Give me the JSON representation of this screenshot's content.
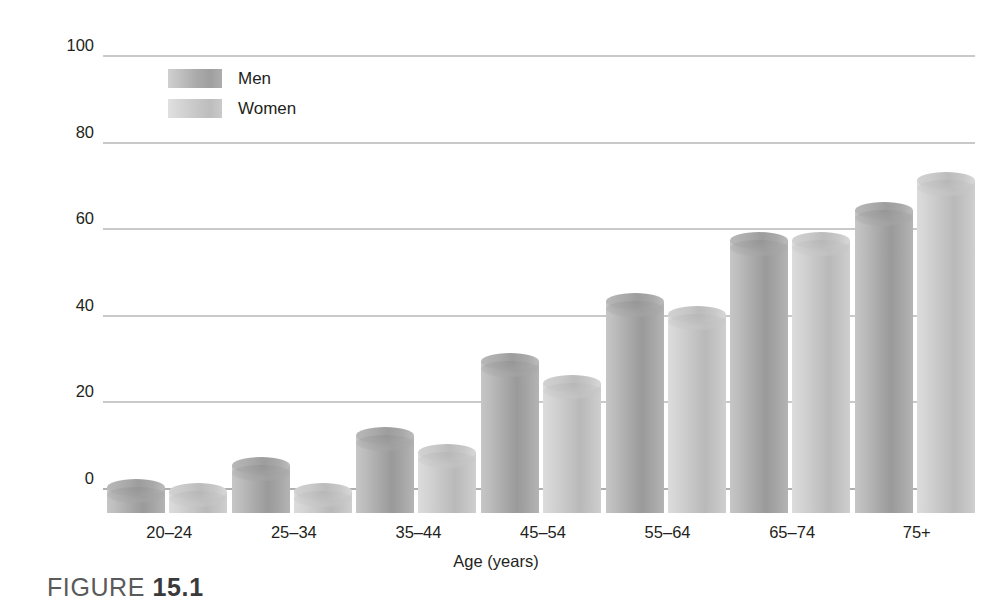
{
  "chart_data": {
    "type": "bar",
    "title": "",
    "xlabel": "Age (years)",
    "ylabel": "Percentage of people with cardiovascular disease",
    "categories": [
      "20–24",
      "25–34",
      "35–44",
      "45–54",
      "55–64",
      "65–74",
      "75+"
    ],
    "series": [
      {
        "name": "Men",
        "values": [
          6,
          11,
          18,
          35,
          49,
          63,
          70
        ]
      },
      {
        "name": "Women",
        "values": [
          5,
          5,
          14,
          30,
          46,
          63,
          77
        ]
      }
    ],
    "ylim": [
      0,
      100
    ],
    "yticks": [
      0,
      20,
      40,
      60,
      80,
      100
    ],
    "ytick_labels": [
      "0",
      "20",
      "40",
      "60",
      "80",
      "100"
    ],
    "grid": true,
    "legend_position": "upper left",
    "colors": {
      "men": "#a8a8a8",
      "women": "#c8c8c8",
      "gridline": "#c9c9c9",
      "axis": "#b0b0b0",
      "text": "#231f20"
    }
  },
  "legend": {
    "items": [
      {
        "label": "Men",
        "key": "men"
      },
      {
        "label": "Women",
        "key": "women"
      }
    ]
  },
  "caption": {
    "prefix": "FIGURE ",
    "number": "15.1"
  }
}
